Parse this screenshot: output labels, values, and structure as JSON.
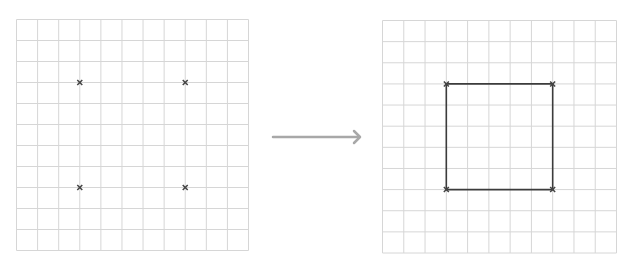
{
  "colors": {
    "background": "#ffffff",
    "grid_line": "#d6d6d6",
    "marker": "#444444",
    "square": "#3c3c3c",
    "arrow": "#a8a8a8"
  },
  "grid": {
    "rows": 11,
    "cols": 11
  },
  "left_panel": {
    "name": "points-grid",
    "x": 16.5,
    "y": 19.5,
    "width": 232,
    "height": 231,
    "points": [
      {
        "col": 3,
        "row": 3
      },
      {
        "col": 8,
        "row": 3
      },
      {
        "col": 3,
        "row": 8
      },
      {
        "col": 8,
        "row": 8
      }
    ]
  },
  "arrow": {
    "x1": 273,
    "y1": 137,
    "x2": 360,
    "y2": 137
  },
  "right_panel": {
    "name": "square-grid",
    "x": 382.5,
    "y": 20.5,
    "width": 234,
    "height": 232.5,
    "points": [
      {
        "col": 3,
        "row": 3
      },
      {
        "col": 8,
        "row": 3
      },
      {
        "col": 8,
        "row": 8
      },
      {
        "col": 3,
        "row": 8
      }
    ],
    "shape": "square"
  }
}
